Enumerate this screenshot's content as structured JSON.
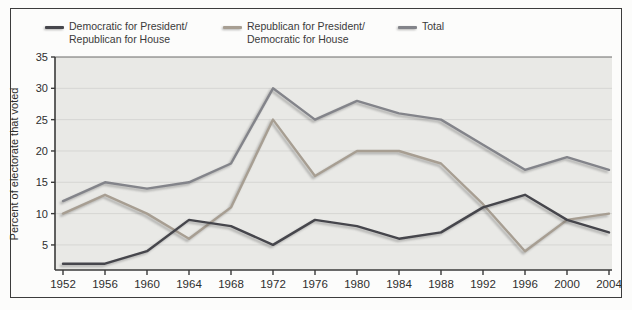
{
  "figure": {
    "y_axis_label": "Percent of electorate that voted",
    "colors": {
      "dem_pres": "#46464c",
      "rep_pres": "#a79e92",
      "total": "#83848a",
      "plot_bg": "#e9e9e6",
      "grid": "#d6d6d3",
      "axis": "#3a3a3a",
      "text": "#2e2e2e"
    }
  },
  "legend": [
    {
      "key": "dem_pres",
      "line1": "Democratic for President/",
      "line2": "Republican for House"
    },
    {
      "key": "rep_pres",
      "line1": "Republican for President/",
      "line2": "Democratic for House"
    },
    {
      "key": "total",
      "line1": "Total",
      "line2": ""
    }
  ],
  "chart_data": {
    "type": "line",
    "title": "",
    "xlabel": "",
    "ylabel": "Percent of electorate that voted",
    "x": [
      1952,
      1956,
      1960,
      1964,
      1968,
      1972,
      1976,
      1980,
      1984,
      1988,
      1992,
      1996,
      2000,
      2004
    ],
    "x_labels": [
      "1952",
      "1956",
      "1960",
      "1964",
      "1968",
      "1972",
      "1976",
      "1980",
      "1984",
      "1988",
      "1992",
      "1996",
      "2000",
      "2004"
    ],
    "series": [
      {
        "name": "Democratic for President/Republican for House",
        "key": "dem_pres",
        "values": [
          2,
          2,
          4,
          9,
          8,
          5,
          9,
          8,
          6,
          7,
          11,
          13,
          9,
          7
        ]
      },
      {
        "name": "Republican for President/Democratic for House",
        "key": "rep_pres",
        "values": [
          10,
          13,
          10,
          6,
          11,
          25,
          16,
          20,
          20,
          18,
          11.5,
          4,
          9,
          10
        ]
      },
      {
        "name": "Total",
        "key": "total",
        "values": [
          12,
          15,
          14,
          15,
          18,
          30,
          25,
          28,
          26,
          25,
          21,
          17,
          19,
          17
        ]
      }
    ],
    "yticks": [
      5,
      10,
      15,
      20,
      25,
      30,
      35
    ],
    "ylim": [
      1,
      35
    ],
    "grid": true,
    "legend_position": "top"
  }
}
